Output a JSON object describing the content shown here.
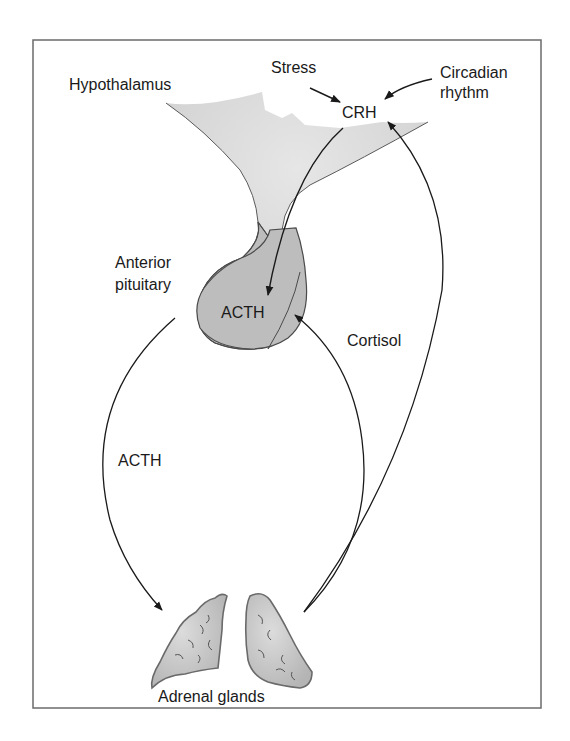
{
  "diagram": {
    "colors": {
      "frame": "#6b6b6b",
      "hypothalamus_fill": "#d8d8d8",
      "pituitary_fill": "#bdbdbd",
      "gland_fill": "#c4c4c4",
      "gland_stroke": "#6a6a6a",
      "arrow": "#1a1a1a",
      "text": "#1a1a1a"
    },
    "labels": {
      "hypothalamus": "Hypothalamus",
      "stress": "Stress",
      "circadian_line1": "Circadian",
      "circadian_line2": "rhythm",
      "crh": "CRH",
      "anterior_line1": "Anterior",
      "anterior_line2": "pituitary",
      "acth_pituitary": "ACTH",
      "cortisol": "Cortisol",
      "acth_path": "ACTH",
      "adrenal_glands": "Adrenal glands"
    },
    "nodes": [
      {
        "id": "hypothalamus",
        "label": "Hypothalamus",
        "hormone": "CRH"
      },
      {
        "id": "anterior-pituitary",
        "label": "Anterior pituitary",
        "hormone": "ACTH"
      },
      {
        "id": "adrenal-glands",
        "label": "Adrenal glands",
        "hormone": "Cortisol"
      }
    ],
    "edges": [
      {
        "from": "Stress",
        "to": "CRH",
        "type": "stimulus"
      },
      {
        "from": "Circadian rhythm",
        "to": "CRH",
        "type": "stimulus"
      },
      {
        "from": "CRH",
        "to": "ACTH (pituitary)",
        "type": "stimulation"
      },
      {
        "from": "ACTH (pituitary)",
        "to": "Adrenal glands",
        "label": "ACTH",
        "type": "stimulation"
      },
      {
        "from": "Adrenal glands",
        "to": "ACTH (pituitary)",
        "label": "Cortisol",
        "type": "feedback"
      },
      {
        "from": "Adrenal glands",
        "to": "CRH",
        "label": "Cortisol",
        "type": "feedback"
      }
    ]
  }
}
